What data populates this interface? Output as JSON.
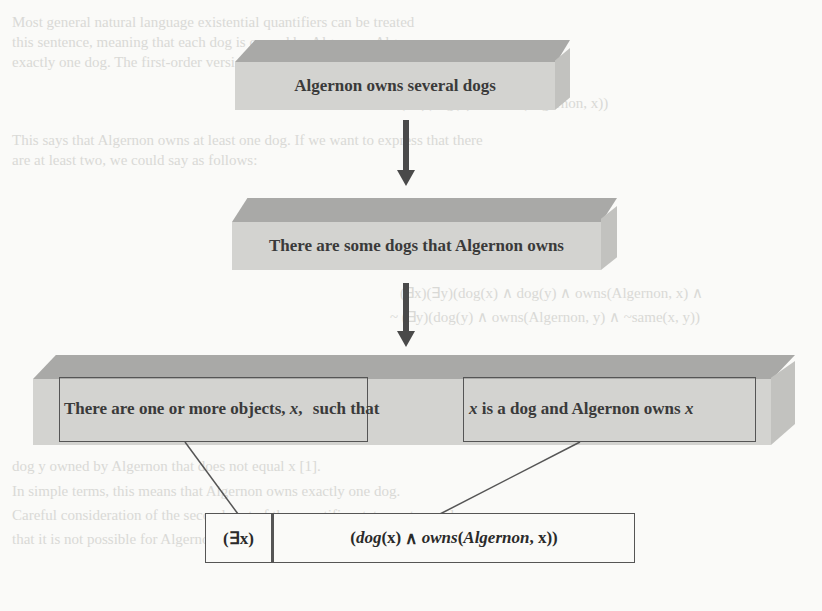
{
  "background_text": [
    {
      "text": "Most general natural language existential quantifiers can be treated",
      "x": 12,
      "y": 28
    },
    {
      "text": "this sentence, meaning that each dog is owned by Algernon. Algernon owns",
      "x": 12,
      "y": 48
    },
    {
      "text": "exactly one dog. The first-order version of this is",
      "x": 12,
      "y": 68
    },
    {
      "text": "(∃x)(dog(x) ∧ owns(Algernon, x))",
      "x": 400,
      "y": 108
    },
    {
      "text": "This says that Algernon owns at least one dog. If we want to express that there",
      "x": 12,
      "y": 146
    },
    {
      "text": "are at least two, we could say as follows:",
      "x": 12,
      "y": 166
    },
    {
      "text": "(∃x)(∃y)(dog(x) ∧ dog(y) ∧ owns(Algernon, x) ∧",
      "x": 400,
      "y": 298
    },
    {
      "text": "~ (∃y)(dog(y) ∧ owns(Algernon, y) ∧ ~same(x, y))",
      "x": 390,
      "y": 322
    },
    {
      "text": "dog y owned by Algernon that does not equal x [1].",
      "x": 12,
      "y": 472
    },
    {
      "text": "In simple terms, this means that Algernon owns exactly one dog.",
      "x": 12,
      "y": 497
    },
    {
      "text": "Careful consideration of the second part of the quantifier statement reveals",
      "x": 12,
      "y": 521
    },
    {
      "text": "that it is not possible for Algernon to own more than one dog.",
      "x": 12,
      "y": 545
    }
  ],
  "diagram": {
    "step1": "Algernon owns several dogs",
    "step2": "There are some dogs that Algernon owns",
    "step3": {
      "part_a": "There are one or more objects,",
      "part_a_var": "x",
      "part_a_comma": ",",
      "connector": "such that",
      "part_b_var1": "x",
      "part_b": "is a dog and Algernon owns",
      "part_b_var2": "x"
    },
    "formula": {
      "quantifier": "(∃x)",
      "matrix_open": "(",
      "pred1": "dog",
      "pred1_arg": "(x)",
      "and": " ∧ ",
      "pred2": "owns",
      "pred2_args_open": "(",
      "pred2_const": "Algernon",
      "pred2_rest": ", x))"
    }
  },
  "colors": {
    "box_front": "#d3d3d0",
    "box_top": "#a9a9a7",
    "arrow": "#4a4a4a",
    "outline": "#555555"
  }
}
